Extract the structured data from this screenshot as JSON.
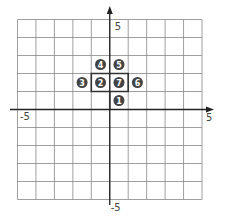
{
  "diagram": {
    "type": "coordinate-grid-path",
    "grid": {
      "xmin": -5,
      "xmax": 5,
      "ymin": -5,
      "ymax": 5,
      "step": 1
    },
    "axis_labels": {
      "y_top": "5",
      "y_bottom": "-5",
      "x_left": "-5",
      "x_right": "5"
    },
    "markers": [
      {
        "label": "1",
        "x": 0.5,
        "y": 0.5
      },
      {
        "label": "2",
        "x": -0.5,
        "y": 1.5
      },
      {
        "label": "3",
        "x": -1.5,
        "y": 1.5
      },
      {
        "label": "4",
        "x": -0.5,
        "y": 2.5
      },
      {
        "label": "5",
        "x": 0.5,
        "y": 2.5
      },
      {
        "label": "6",
        "x": 1.5,
        "y": 1.5
      },
      {
        "label": "7",
        "x": 0.5,
        "y": 1.5
      }
    ],
    "path_points": [
      [
        0,
        0
      ],
      [
        0,
        1
      ],
      [
        -1,
        1
      ],
      [
        -1,
        2
      ],
      [
        0,
        2
      ],
      [
        1,
        2
      ],
      [
        1,
        1
      ],
      [
        0,
        1
      ]
    ],
    "colors": {
      "grid": "#888888",
      "axis": "#222222",
      "marker": "#444444",
      "path": "#333333"
    }
  }
}
